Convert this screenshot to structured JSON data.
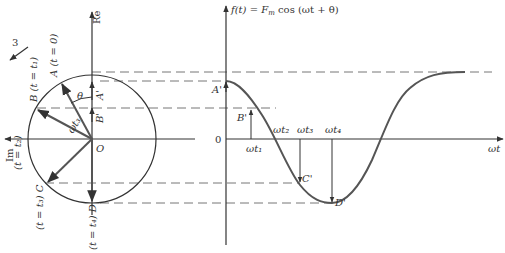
{
  "figure": {
    "title_formula": "f(t) = F_m cos(ωt + θ)",
    "phasor": {
      "axes": {
        "real": "Re",
        "imag": "Im",
        "origin": "O"
      },
      "rotation_marker": "3",
      "points": [
        {
          "id": "A",
          "label": "A (t = 0)"
        },
        {
          "id": "B",
          "label": "B (t = t₁)"
        },
        {
          "id": "B2",
          "label": "(t = t₂)"
        },
        {
          "id": "C",
          "label": "(t = t₃) C"
        },
        {
          "id": "D",
          "label": "(t = t₄) D"
        }
      ],
      "angle_label": "θ",
      "radius_label": "t₃",
      "projections": [
        "A'",
        "B'"
      ]
    },
    "waveform": {
      "y_axis_label": "f(t) = F_m cos(ωt + θ)",
      "x_axis_label": "ωt",
      "zero_label": "0",
      "ticks": [
        "ωt₁",
        "ωt₂",
        "ωt₃",
        "ωt₄"
      ],
      "points": [
        "A'",
        "B'",
        "C'",
        "D'"
      ]
    }
  },
  "labels": {
    "re": "Re",
    "im": "Im",
    "o": "O",
    "three": "3",
    "a": "A (t = 0)",
    "b": "B (t = t₁)",
    "t2": "(t = t₂)",
    "c": "(t = t₃) C",
    "d": "(t = t₄) D",
    "theta": "θ",
    "wt3r": "ωt₃",
    "aprime": "A'",
    "bprime": "B'",
    "cprime": "C'",
    "dprime": "D'",
    "ft": "f(t) = F",
    "m": "m",
    "cos": " cos (ωt + θ)",
    "zero": "0",
    "wt": "ωt",
    "wt1": "ωt₁",
    "wt2": "ωt₂",
    "wt3": "ωt₃",
    "wt4": "ωt₄"
  }
}
